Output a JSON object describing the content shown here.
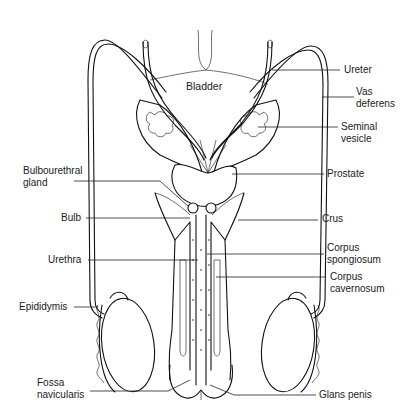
{
  "diagram": {
    "colors": {
      "line": "#111111",
      "background": "#ffffff",
      "text": "#1a1a1a"
    },
    "labels": {
      "bladder": "Bladder",
      "ureter": "Ureter",
      "vas_deferens": "Vas\ndeferens",
      "seminal_vesicle": "Seminal\nvesicle",
      "prostate": "Prostate",
      "bulbourethral_gland": "Bulbourethral\ngland",
      "crus": "Crus",
      "bulb": "Bulb",
      "corpus_spongiosum": "Corpus\nspongiosum",
      "urethra": "Urethra",
      "corpus_cavernosum": "Corpus\ncavernosum",
      "epididymis": "Epididymis",
      "fossa_navicularis": "Fossa\nnavicularis",
      "glans_penis": "Glans penis"
    }
  }
}
